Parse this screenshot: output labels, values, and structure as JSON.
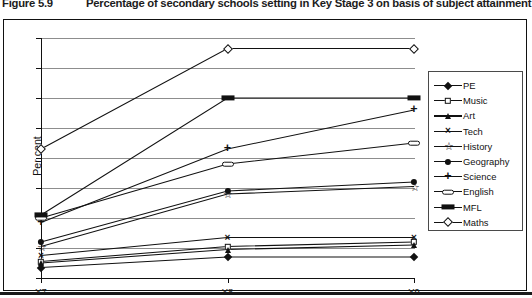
{
  "figure": {
    "number": "Figure 5.9",
    "title": "Percentage of secondary schools setting in Key Stage 3 on basis of subject attainment"
  },
  "chart_data": {
    "type": "line",
    "title": "Percentage of secondary schools setting in Key Stage 3 on basis of subject attainment",
    "xlabel": "",
    "ylabel": "Per cent",
    "categories": [
      "Y7",
      "Y8",
      "Y9"
    ],
    "ylim": [
      0,
      80
    ],
    "yticks": [
      0,
      10,
      20,
      30,
      40,
      50,
      60,
      70,
      80
    ],
    "grid": true,
    "legend_position": "right",
    "series": [
      {
        "name": "PE",
        "marker": "diamond",
        "values": [
          3.5,
          7,
          7
        ]
      },
      {
        "name": "Music",
        "marker": "square",
        "values": [
          5.5,
          10.5,
          12
        ]
      },
      {
        "name": "Art",
        "marker": "triangle",
        "values": [
          5,
          9.5,
          11
        ]
      },
      {
        "name": "Tech",
        "marker": "cross",
        "values": [
          7.5,
          13.5,
          13.5
        ]
      },
      {
        "name": "History",
        "marker": "star",
        "values": [
          10.5,
          28,
          30.5
        ]
      },
      {
        "name": "Geography",
        "marker": "circle",
        "values": [
          12,
          29,
          32
        ]
      },
      {
        "name": "Science",
        "marker": "plus",
        "values": [
          18.5,
          43,
          56
        ]
      },
      {
        "name": "English",
        "marker": "pill",
        "values": [
          20,
          38,
          45
        ]
      },
      {
        "name": "MFL",
        "marker": "bar",
        "values": [
          21,
          60,
          60
        ]
      },
      {
        "name": "Maths",
        "marker": "odiamond",
        "values": [
          43,
          76.5,
          76.5
        ]
      }
    ]
  }
}
